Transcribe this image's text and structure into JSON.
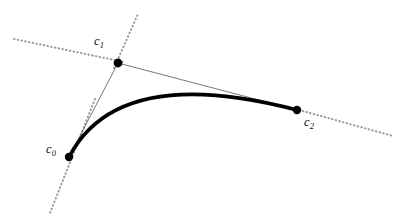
{
  "figure": {
    "type": "geometric-diagram",
    "background_color": "#ffffff",
    "width": 412,
    "height": 218
  },
  "labels": {
    "c0": {
      "base": "c",
      "sub": "0",
      "text": "c0"
    },
    "c1": {
      "base": "c",
      "sub": "1",
      "text": "c1"
    },
    "c2": {
      "base": "c",
      "sub": "2",
      "text": "c2"
    }
  },
  "chart_data": {
    "type": "scatter",
    "title": "",
    "xlabel": "",
    "ylabel": "",
    "xlim": [
      0,
      412
    ],
    "ylim": [
      218,
      0
    ],
    "grid": false,
    "legend": "none",
    "control_points": [
      {
        "name": "c0",
        "x": 69,
        "y": 157,
        "label": "c0",
        "label_x": 52,
        "label_y": 151
      },
      {
        "name": "c1",
        "x": 118,
        "y": 63,
        "label": "c1",
        "label_x": 100,
        "label_y": 43
      },
      {
        "name": "c2",
        "x": 297,
        "y": 110,
        "label": "c2",
        "label_x": 310,
        "label_y": 124
      }
    ],
    "bezier_curve": {
      "kind": "quadratic",
      "start": [
        69,
        157
      ],
      "control": [
        118,
        63
      ],
      "end": [
        297,
        110
      ],
      "stroke": "#000000",
      "stroke_width": 3.6
    },
    "control_polygon": [
      {
        "from": "c0",
        "to": "c1",
        "x1": 69,
        "y1": 157,
        "x2": 118,
        "y2": 63
      },
      {
        "from": "c1",
        "to": "c2",
        "x1": 118,
        "y1": 63,
        "x2": 297,
        "y2": 110
      }
    ],
    "control_polygon_style": {
      "stroke": "#555555",
      "stroke_width": 0.8
    },
    "tangent_lines": [
      {
        "through": "c0",
        "x1": 95,
        "y1": 99,
        "x2": 50,
        "y2": 213,
        "note": "dotted line through c0"
      },
      {
        "through": "c1",
        "x1": 14,
        "y1": 39,
        "x2": 138,
        "y2": 14,
        "note": "dotted line through c1 (upper-left branch)"
      },
      {
        "through": "c1",
        "x1": 118,
        "y1": 63,
        "x2": 138,
        "y2": 14,
        "note": "dotted line through c1 (upper-right branch)"
      },
      {
        "through": "c2",
        "x1": 297,
        "y1": 110,
        "x2": 393,
        "y2": 136,
        "note": "dotted line through c2"
      }
    ],
    "tangent_style": {
      "stroke": "#9a9a9a",
      "stroke_width": 2.0,
      "dash": "0.6 3.2",
      "linecap": "round"
    },
    "point_marker": {
      "shape": "circle",
      "radius": 4.2,
      "fill": "#000000"
    }
  }
}
